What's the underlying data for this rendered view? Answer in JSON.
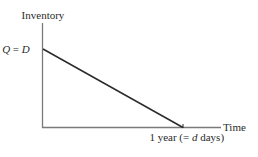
{
  "diagram": {
    "type": "inventory-sawtooth-single-cycle",
    "y_axis_label": "Inventory",
    "x_axis_label": "Time",
    "y_intercept_label": {
      "lhs": "Q",
      "eq": " = ",
      "rhs": "D"
    },
    "x_end_label": {
      "prefix": "1 year (= ",
      "var": "d",
      "suffix": " days)"
    },
    "line": {
      "description": "Inventory decreases linearly from Q = D at time 0 to 0 at 1 year",
      "start": {
        "time": 0,
        "inventory": "Q = D"
      },
      "end": {
        "time": "1 year (= d days)",
        "inventory": 0
      }
    },
    "colors": {
      "axis": "#7a7a7a",
      "line": "#2b2b2b",
      "text": "#2a2a2a"
    }
  }
}
